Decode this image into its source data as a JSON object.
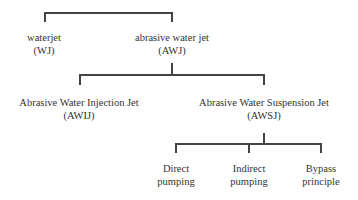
{
  "diagram": {
    "type": "tree",
    "root": {
      "children": [
        {
          "label": "waterjet",
          "abbr": "(WJ)"
        },
        {
          "label": "abrasive water jet",
          "abbr": "(AWJ)",
          "children": [
            {
              "label": "Abrasive Water Injection Jet",
              "abbr": "(AWIJ)"
            },
            {
              "label": "Abrasive Water Suspension Jet",
              "abbr": "(AWSJ)",
              "children": [
                {
                  "line1": "Direct",
                  "line2": "pumping"
                },
                {
                  "line1": "Indirect",
                  "line2": "pumping"
                },
                {
                  "line1": "Bypass",
                  "line2": "principle"
                }
              ]
            }
          ]
        }
      ]
    }
  },
  "colors": {
    "line": "#444444",
    "text": "#333333"
  }
}
